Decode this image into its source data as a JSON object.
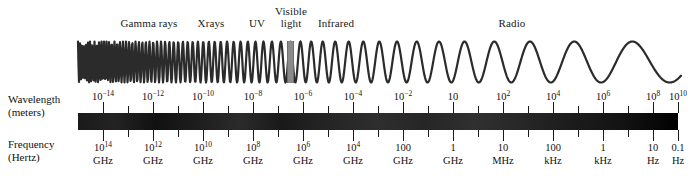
{
  "figure": {
    "wave_color": "#2b2b2b",
    "visible_marker_color": "#8a8a8a",
    "bar_color_dark": "#111111"
  },
  "bands": [
    {
      "name": "gamma-rays",
      "label": "Gamma rays",
      "x": 149,
      "y": 18
    },
    {
      "name": "xrays",
      "label": "Xrays",
      "x": 211,
      "y": 18
    },
    {
      "name": "uv",
      "label": "UV",
      "x": 257,
      "y": 18
    },
    {
      "name": "visible-light",
      "label": "Visible\nlight",
      "x": 290,
      "y": 6
    },
    {
      "name": "infrared",
      "label": "Infrared",
      "x": 336,
      "y": 18
    },
    {
      "name": "radio",
      "label": "Radio",
      "x": 512,
      "y": 18
    }
  ],
  "axes": {
    "wavelength": {
      "caption": "Wavelength\n(meters)",
      "caption_x": 8,
      "caption_y": 93,
      "values": [
        "10⁻¹⁴",
        "10⁻¹²",
        "10⁻¹⁰",
        "10⁻⁸",
        "10⁻⁶",
        "10⁻⁴",
        "10⁻²",
        "10",
        "10²",
        "10⁴",
        "10⁶",
        "10⁸",
        "10¹⁰"
      ],
      "mantissas": [
        "10",
        "10",
        "10",
        "10",
        "10",
        "10",
        "10",
        "10",
        "10",
        "10",
        "10",
        "10",
        "10"
      ],
      "exponents": [
        "-14",
        "-12",
        "-10",
        "-8",
        "-6",
        "-4",
        "-2",
        "",
        "2",
        "4",
        "6",
        "8",
        "10"
      ]
    },
    "frequency": {
      "caption": "Frequency\n(Hertz)",
      "caption_x": 8,
      "caption_y": 138,
      "mantissas": [
        "10",
        "10",
        "10",
        "10",
        "10",
        "10",
        "100",
        "1",
        "10",
        "100",
        "1",
        "10",
        "0.1"
      ],
      "exponents": [
        "14",
        "12",
        "10",
        "8",
        "6",
        "4",
        "",
        "",
        "",
        "",
        "",
        "",
        ""
      ],
      "units": [
        "GHz",
        "GHz",
        "GHz",
        "GHz",
        "GHz",
        "GHz",
        "GHz",
        "GHz",
        "MHz",
        "kHz",
        "kHz",
        "Hz",
        "Hz"
      ]
    },
    "tick_x": [
      103,
      153,
      203,
      253,
      303,
      353,
      403,
      453,
      503,
      553,
      603,
      653,
      678
    ],
    "minor_tick_x": [
      128,
      178,
      228,
      278,
      328,
      378,
      428,
      478,
      528,
      578,
      628
    ]
  },
  "chart_data": {
    "type": "line",
    "xlabel": "Wavelength (meters) / Frequency (Hertz)",
    "ylabel": "",
    "grid": false,
    "legend": "none",
    "categories": [
      "Gamma rays",
      "Xrays",
      "UV",
      "Visible light",
      "Infrared",
      "Radio"
    ],
    "wavelength_ticks_meters": [
      "1e-14",
      "1e-12",
      "1e-10",
      "1e-8",
      "1e-6",
      "1e-4",
      "1e-2",
      "10",
      "1e2",
      "1e4",
      "1e6",
      "1e8",
      "1e10"
    ],
    "frequency_ticks_hertz": [
      "1e14 GHz",
      "1e12 GHz",
      "1e10 GHz",
      "1e8 GHz",
      "1e6 GHz",
      "1e4 GHz",
      "100 GHz",
      "1 GHz",
      "10 MHz",
      "100 kHz",
      "1 kHz",
      "10 Hz",
      "0.1 Hz"
    ],
    "series": [
      {
        "name": "electromagnetic wave",
        "description": "chirped sinusoid: wavelength increases left to right across the spectrum"
      }
    ],
    "annotations": [
      {
        "text": "Visible light marker",
        "x_px": 290
      }
    ]
  }
}
